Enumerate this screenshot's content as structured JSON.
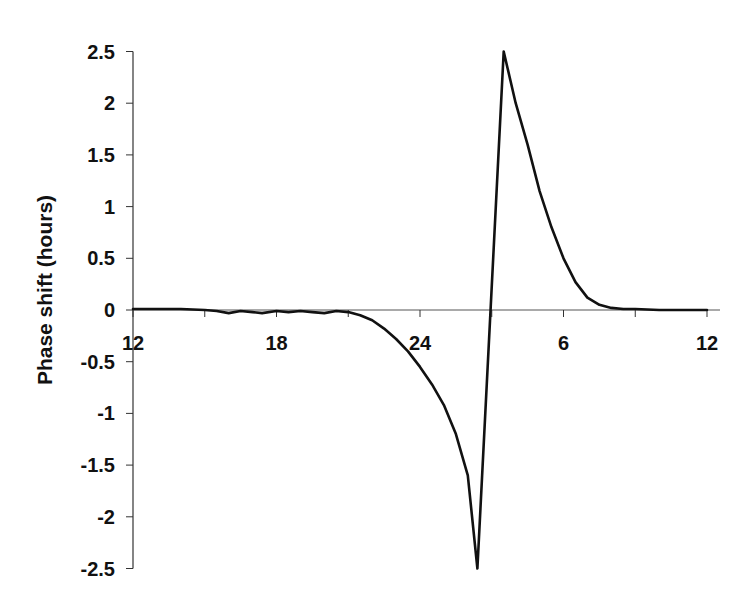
{
  "chart_data": {
    "type": "line",
    "title": "",
    "xlabel": "",
    "ylabel": "Phase shift (hours)",
    "x_unit": "clock time (hours, continuous 12 to 36; 24+ wraps to next day)",
    "xlim": [
      12,
      36
    ],
    "ylim": [
      -2.5,
      2.5
    ],
    "grid": false,
    "legend": "none",
    "x_ticks": [
      12,
      15,
      18,
      21,
      24,
      27,
      30,
      33,
      36
    ],
    "x_tick_labels": [
      {
        "x": 12,
        "label": "12"
      },
      {
        "x": 18,
        "label": "18"
      },
      {
        "x": 24,
        "label": "24"
      },
      {
        "x": 30,
        "label": "6"
      },
      {
        "x": 36,
        "label": "12"
      }
    ],
    "y_ticks": [
      2.5,
      2,
      1.5,
      1,
      0.5,
      0,
      -0.5,
      -1,
      -1.5,
      -2,
      -2.5
    ],
    "y_tick_labels": [
      "2.5",
      "2",
      "1.5",
      "1",
      "0.5",
      "0",
      "-0.5",
      "-1",
      "-1.5",
      "-2",
      "-2.5"
    ],
    "series": [
      {
        "name": "Phase response curve",
        "color": "#111111",
        "x": [
          12,
          13,
          14,
          15,
          15.5,
          16,
          16.5,
          17,
          17.4,
          18,
          18.5,
          19,
          19.5,
          20,
          20.5,
          21,
          21.5,
          22,
          22.5,
          23,
          23.5,
          24,
          24.5,
          25,
          25.5,
          26,
          26.4,
          27.5,
          28,
          28.5,
          29,
          29.5,
          30,
          30.5,
          31,
          31.5,
          32,
          32.5,
          33,
          34,
          35,
          36
        ],
        "values": [
          0.01,
          0.01,
          0.01,
          0.0,
          -0.01,
          -0.03,
          -0.01,
          -0.02,
          -0.03,
          -0.01,
          -0.02,
          -0.01,
          -0.02,
          -0.03,
          -0.01,
          -0.02,
          -0.05,
          -0.1,
          -0.18,
          -0.28,
          -0.4,
          -0.55,
          -0.72,
          -0.92,
          -1.2,
          -1.6,
          -2.5,
          2.5,
          2.0,
          1.6,
          1.15,
          0.8,
          0.5,
          0.27,
          0.12,
          0.05,
          0.02,
          0.01,
          0.01,
          0.0,
          0.0,
          0.0
        ]
      }
    ]
  }
}
